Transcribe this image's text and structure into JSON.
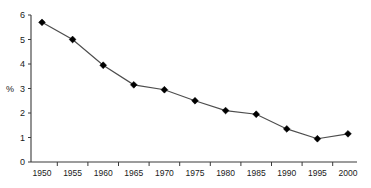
{
  "chart_data": {
    "type": "line",
    "title": "",
    "subtitle": "",
    "xlabel": "",
    "ylabel": "%",
    "categories": [
      "1950",
      "1955",
      "1960",
      "1965",
      "1970",
      "1975",
      "1980",
      "1985",
      "1990",
      "1995",
      "2000"
    ],
    "x": [
      1950,
      1955,
      1960,
      1965,
      1970,
      1975,
      1980,
      1985,
      1990,
      1995,
      2000
    ],
    "values": [
      5.7,
      5.0,
      3.95,
      3.15,
      2.95,
      2.5,
      2.1,
      1.95,
      1.35,
      0.95,
      1.15
    ],
    "series": [
      {
        "name": "",
        "values": [
          5.7,
          5.0,
          3.95,
          3.15,
          2.95,
          2.5,
          2.1,
          1.95,
          1.35,
          0.95,
          1.15
        ]
      }
    ],
    "ylim": [
      0,
      6
    ],
    "yticks": [
      0,
      1,
      2,
      3,
      4,
      5,
      6
    ],
    "ytick_labels": [
      "0",
      "1",
      "2",
      "3",
      "4",
      "5",
      "6"
    ],
    "xtick_labels": [
      "1950",
      "1955",
      "1960",
      "1965",
      "1970",
      "1975",
      "1980",
      "1985",
      "1990",
      "1995",
      "2000"
    ],
    "xlim": [
      1950,
      2000
    ],
    "grid": false,
    "legend": "none",
    "marker": "diamond",
    "line_color": "#4d4d4d",
    "marker_color": "#000000",
    "axis_color": "#3a3a3a",
    "background_color": "#ffffff",
    "annotations": []
  }
}
